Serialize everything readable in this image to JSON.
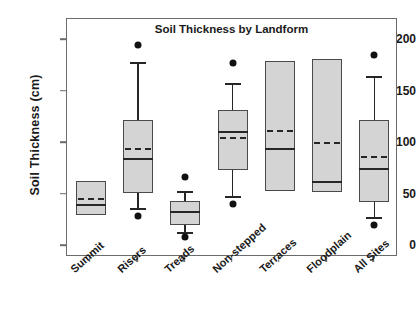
{
  "chart_data": {
    "type": "box",
    "title": "Soil Thickness by Landform",
    "xlabel": "",
    "ylabel": "Soil Thickness (cm)",
    "ylim": [
      0,
      215
    ],
    "yticks": [
      0,
      50,
      100,
      150,
      200
    ],
    "ytick_labels": [
      "0",
      "50",
      "100",
      "150",
      "200"
    ],
    "grid": false,
    "legend": "none",
    "categories": [
      "Summit",
      "Risers",
      "Treads",
      "Non-stepped",
      "Terraces",
      "Floodplain",
      "All Sites"
    ],
    "box_fill_color": "#d4d4d4",
    "box_edge_color": "#4a4a4a",
    "median_style": "solid",
    "mean_style": "dashed",
    "boxes": [
      {
        "category": "Summit",
        "q1": 30,
        "q3": 63,
        "median": 40,
        "mean": 46,
        "whisker_low": null,
        "whisker_high": null,
        "outliers": []
      },
      {
        "category": "Risers",
        "q1": 51,
        "q3": 122,
        "median": 84,
        "mean": 94,
        "whisker_low": 37,
        "whisker_high": 179,
        "outliers": [
          29,
          195
        ]
      },
      {
        "category": "Treads",
        "q1": 20,
        "q3": 44,
        "median": 33,
        "mean": 33,
        "whisker_low": 14,
        "whisker_high": 53,
        "outliers": [
          9,
          67
        ]
      },
      {
        "category": "Non-stepped",
        "q1": 74,
        "q3": 132,
        "median": 111,
        "mean": 105,
        "whisker_low": 49,
        "whisker_high": 158,
        "outliers": [
          41,
          178
        ]
      },
      {
        "category": "Terraces",
        "q1": 53,
        "q3": 180,
        "median": 94,
        "mean": 112,
        "whisker_low": null,
        "whisker_high": null,
        "outliers": []
      },
      {
        "category": "Floodplain",
        "q1": 52,
        "q3": 182,
        "median": 62,
        "mean": 100,
        "whisker_low": null,
        "whisker_high": null,
        "outliers": []
      },
      {
        "category": "All Sites",
        "q1": 43,
        "q3": 122,
        "median": 75,
        "mean": 86,
        "whisker_low": 28,
        "whisker_high": 165,
        "outliers": [
          20,
          185
        ]
      }
    ]
  }
}
